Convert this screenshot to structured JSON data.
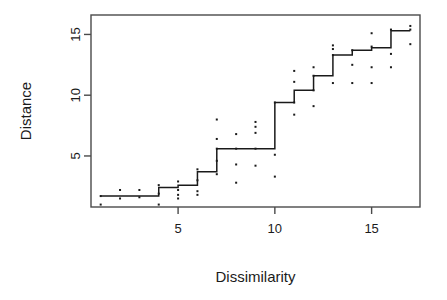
{
  "chart_data": {
    "type": "scatter",
    "title": "",
    "xlabel": "Dissimilarity",
    "ylabel": "Distance",
    "xlim": [
      0.5,
      17.5
    ],
    "ylim": [
      0.8,
      16.6
    ],
    "xticks": [
      5,
      10,
      15
    ],
    "yticks": [
      5,
      10,
      15
    ],
    "grid": false,
    "legend": null,
    "series": [
      {
        "name": "observations",
        "type": "scatter",
        "marker": "point",
        "color": "#1a1a1a",
        "points": [
          [
            1,
            1.7
          ],
          [
            1,
            1.0
          ],
          [
            2,
            2.2
          ],
          [
            2,
            1.5
          ],
          [
            3,
            2.2
          ],
          [
            3,
            1.6
          ],
          [
            4,
            2.6
          ],
          [
            4,
            1.9
          ],
          [
            4,
            1.0
          ],
          [
            5,
            2.9
          ],
          [
            5,
            2.2
          ],
          [
            5,
            1.8
          ],
          [
            5,
            1.5
          ],
          [
            6,
            3.9
          ],
          [
            6,
            3.0
          ],
          [
            6,
            2.1
          ],
          [
            6,
            1.8
          ],
          [
            7,
            8.0
          ],
          [
            7,
            6.4
          ],
          [
            7,
            5.6
          ],
          [
            7,
            4.6
          ],
          [
            7,
            3.5
          ],
          [
            8,
            6.8
          ],
          [
            8,
            5.6
          ],
          [
            8,
            4.3
          ],
          [
            8,
            2.8
          ],
          [
            9,
            7.8
          ],
          [
            9,
            7.4
          ],
          [
            9,
            6.9
          ],
          [
            9,
            5.6
          ],
          [
            9,
            4.2
          ],
          [
            10,
            9.4
          ],
          [
            10,
            5.1
          ],
          [
            10,
            3.3
          ],
          [
            11,
            12.0
          ],
          [
            11,
            11.1
          ],
          [
            11,
            9.4
          ],
          [
            11,
            8.4
          ],
          [
            12,
            12.3
          ],
          [
            12,
            11.6
          ],
          [
            12,
            10.4
          ],
          [
            12,
            9.1
          ],
          [
            13,
            14.1
          ],
          [
            13,
            13.8
          ],
          [
            13,
            13.3
          ],
          [
            13,
            11.0
          ],
          [
            14,
            13.7
          ],
          [
            14,
            12.5
          ],
          [
            14,
            11.0
          ],
          [
            15,
            15.1
          ],
          [
            15,
            14.0
          ],
          [
            15,
            12.3
          ],
          [
            15,
            11.0
          ],
          [
            16,
            15.4
          ],
          [
            16,
            13.4
          ],
          [
            16,
            12.3
          ],
          [
            17,
            15.7
          ],
          [
            17,
            15.4
          ],
          [
            17,
            14.2
          ]
        ]
      },
      {
        "name": "monotone-step-fit",
        "type": "step",
        "color": "#1a1a1a",
        "x": [
          1,
          2,
          3,
          4,
          5,
          6,
          7,
          8,
          9,
          10,
          11,
          12,
          13,
          14,
          15,
          16,
          17
        ],
        "y": [
          1.7,
          1.7,
          1.7,
          2.4,
          2.6,
          3.7,
          5.6,
          5.6,
          5.6,
          9.4,
          10.4,
          11.6,
          13.3,
          13.7,
          13.9,
          15.3,
          15.3
        ]
      }
    ]
  },
  "axes": {
    "x_tick_labels": [
      "5",
      "10",
      "15"
    ],
    "y_tick_labels": [
      "5",
      "10",
      "15"
    ],
    "x_axis_title": "Dissimilarity",
    "y_axis_title": "Distance"
  },
  "style": {
    "foreground": "#1a1a1a",
    "background": "#ffffff",
    "frame_color": "#4a4a4a"
  }
}
